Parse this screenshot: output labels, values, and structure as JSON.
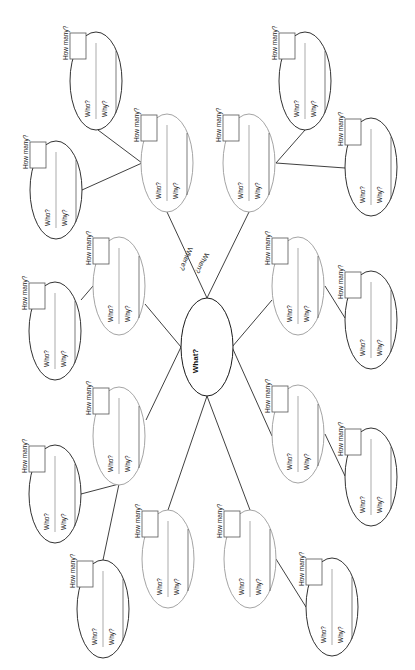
{
  "diagram": {
    "center": {
      "label": "What?",
      "cx": 207,
      "cy": 347,
      "rx": 26,
      "ry": 49
    },
    "spoke_labels": [
      {
        "label": "Where?",
        "x": 184,
        "y": 258
      },
      {
        "label": "When?",
        "x": 200,
        "y": 262
      }
    ],
    "node_text": {
      "who": "Who?",
      "why": "Why?",
      "how_many": "How many?"
    },
    "colors": {
      "dark": "#1a1a1a",
      "grey": "#9a9a9a",
      "line": "#2a2a2a"
    },
    "nodes": [
      {
        "id": "A",
        "cx": 96,
        "cy": 81,
        "tone": "dark"
      },
      {
        "id": "B",
        "cx": 56,
        "cy": 190,
        "tone": "dark"
      },
      {
        "id": "C",
        "cx": 167,
        "cy": 163,
        "tone": "grey"
      },
      {
        "id": "D",
        "cx": 249,
        "cy": 163,
        "tone": "grey"
      },
      {
        "id": "E",
        "cx": 305,
        "cy": 81,
        "tone": "dark"
      },
      {
        "id": "F",
        "cx": 371,
        "cy": 167,
        "tone": "dark"
      },
      {
        "id": "G",
        "cx": 119,
        "cy": 286,
        "tone": "grey"
      },
      {
        "id": "H",
        "cx": 55,
        "cy": 331,
        "tone": "dark"
      },
      {
        "id": "I",
        "cx": 298,
        "cy": 286,
        "tone": "grey"
      },
      {
        "id": "J",
        "cx": 371,
        "cy": 320,
        "tone": "dark"
      },
      {
        "id": "K",
        "cx": 119,
        "cy": 436,
        "tone": "grey"
      },
      {
        "id": "L",
        "cx": 55,
        "cy": 494,
        "tone": "dark"
      },
      {
        "id": "M",
        "cx": 103,
        "cy": 609,
        "tone": "dark"
      },
      {
        "id": "N",
        "cx": 168,
        "cy": 559,
        "tone": "grey"
      },
      {
        "id": "O",
        "cx": 250,
        "cy": 559,
        "tone": "grey"
      },
      {
        "id": "P",
        "cx": 332,
        "cy": 607,
        "tone": "dark"
      },
      {
        "id": "Q",
        "cx": 298,
        "cy": 434,
        "tone": "grey"
      },
      {
        "id": "R",
        "cx": 371,
        "cy": 477,
        "tone": "dark"
      }
    ],
    "edges": [
      [
        207,
        298,
        167,
        212
      ],
      [
        207,
        298,
        249,
        212
      ],
      [
        181,
        347,
        145,
        304
      ],
      [
        181,
        347,
        146,
        420
      ],
      [
        232,
        347,
        272,
        300
      ],
      [
        232,
        347,
        272,
        436
      ],
      [
        207,
        396,
        168,
        510
      ],
      [
        207,
        396,
        250,
        510
      ],
      [
        142,
        163,
        98,
        130
      ],
      [
        142,
        163,
        82,
        190
      ],
      [
        276,
        163,
        305,
        130
      ],
      [
        276,
        163,
        345,
        168
      ],
      [
        93,
        286,
        81,
        300
      ],
      [
        325,
        286,
        345,
        318
      ],
      [
        119,
        484,
        81,
        494
      ],
      [
        119,
        484,
        103,
        560
      ],
      [
        325,
        434,
        345,
        476
      ],
      [
        276,
        559,
        306,
        607
      ]
    ]
  }
}
